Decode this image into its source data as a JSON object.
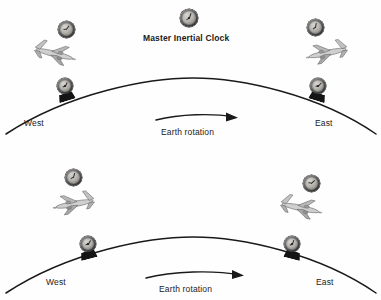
{
  "figure": {
    "title": "Master Inertial Clock",
    "background_color": "#fefefe",
    "line_color": "#1a1a1a",
    "text_color": "#1b1b1b"
  },
  "master_clock": {
    "label": "Master Inertial Clock",
    "icon": "clock-icon"
  },
  "panels": [
    {
      "id": "eastward-and-westward-flights-top",
      "west_label": "West",
      "east_label": "East",
      "rotation_label": "Earth rotation",
      "rotation_arrow": "curved-arrow-right-icon",
      "ground_clocks": [
        {
          "position": "west",
          "icon": "clock-icon"
        },
        {
          "position": "east",
          "icon": "clock-icon"
        }
      ],
      "aircraft": [
        {
          "position": "west",
          "heading": "westward",
          "icon": "airplane-icon",
          "clock": "clock-icon"
        },
        {
          "position": "east",
          "heading": "eastward",
          "icon": "airplane-icon",
          "clock": "clock-icon"
        }
      ]
    },
    {
      "id": "eastward-and-westward-flights-bottom",
      "west_label": "West",
      "east_label": "East",
      "rotation_label": "Earth rotation",
      "rotation_arrow": "curved-arrow-right-icon",
      "ground_clocks": [
        {
          "position": "west",
          "icon": "clock-icon"
        },
        {
          "position": "east",
          "icon": "clock-icon"
        }
      ],
      "aircraft": [
        {
          "position": "west",
          "heading": "eastward",
          "icon": "airplane-icon",
          "clock": "clock-icon"
        },
        {
          "position": "east",
          "heading": "westward",
          "icon": "airplane-icon",
          "clock": "clock-icon"
        }
      ]
    }
  ]
}
